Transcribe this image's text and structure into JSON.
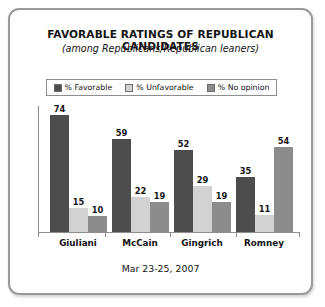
{
  "chart_data": {
    "type": "bar",
    "title": "FAVORABLE RATINGS OF REPUBLICAN CANDIDATES",
    "subtitle": "(among Republicans/Republican leaners)",
    "footnote": "Mar 23-25, 2007",
    "categories": [
      "Giuliani",
      "McCain",
      "Gingrich",
      "Romney"
    ],
    "series": [
      {
        "name": "% Favorable",
        "color": "#4d4d4d",
        "values": [
          74,
          59,
          52,
          35
        ]
      },
      {
        "name": "% Unfavorable",
        "color": "#d2d2d2",
        "values": [
          15,
          22,
          29,
          11
        ]
      },
      {
        "name": "% No opinion",
        "color": "#8c8c8c",
        "values": [
          10,
          19,
          19,
          54
        ]
      }
    ],
    "xlabel": "",
    "ylabel": "",
    "ylim": [
      0,
      80
    ],
    "grid": false,
    "legend_position": "top",
    "axis_color": "#8e8e8e"
  },
  "frame": {
    "border_color": "#9a9a9a",
    "background": "#ffffff"
  }
}
